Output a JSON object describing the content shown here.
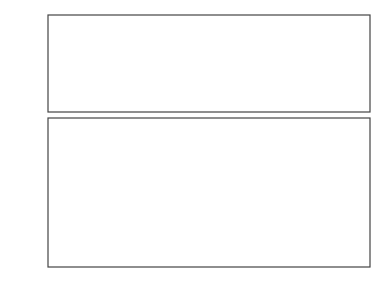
{
  "chart_data": [
    {
      "type": "line",
      "title": "",
      "ylabel_lines": [
        "CV",
        "&",
        "SP",
        "[%]"
      ],
      "xlabel": "",
      "ylim": [
        40,
        80
      ],
      "yticks": [
        "80",
        "40"
      ],
      "grid": false,
      "annotations": [
        "SP",
        "CV"
      ],
      "series": [
        {
          "name": "SP",
          "style": "dashed",
          "values": [
            60,
            60,
            60,
            60,
            60,
            60,
            60,
            60,
            60,
            60,
            60,
            60,
            60,
            60,
            60,
            60,
            60,
            60,
            60,
            60,
            60,
            60,
            60,
            60,
            60,
            60,
            60,
            60,
            60,
            60,
            60,
            60,
            60,
            60,
            60,
            60,
            60,
            60,
            60,
            60,
            60,
            60,
            60,
            60,
            60,
            60,
            60,
            60,
            60,
            60,
            60,
            60,
            60,
            60,
            60,
            60,
            60,
            60,
            60,
            60,
            60,
            60,
            60,
            60,
            60,
            60,
            60,
            60,
            60,
            60,
            60,
            60,
            60,
            60,
            60,
            60,
            60,
            60,
            60,
            60
          ]
        },
        {
          "name": "CV",
          "style": "solid",
          "values": [
            60.5,
            59,
            61,
            58.5,
            60,
            59,
            61.5,
            60.5,
            59,
            60,
            61,
            59.5,
            58.5,
            60.5,
            59,
            61,
            60,
            58,
            59.5,
            61,
            60,
            59,
            60.5,
            61.5,
            59,
            58.5,
            60,
            57.5,
            59,
            60,
            61,
            60.5,
            59.5,
            61,
            62,
            60,
            59.5,
            61,
            60,
            59,
            60.5,
            61,
            59,
            60,
            59.5,
            60.5,
            59,
            61,
            60,
            59.5,
            62,
            60,
            59,
            60.5,
            61,
            59.5,
            60.5,
            60,
            61,
            59,
            60,
            60.5,
            59,
            58,
            57.5,
            58,
            57,
            58,
            59.5,
            60,
            61,
            60.5,
            59.5,
            61,
            60,
            59,
            60.5,
            59.5,
            60,
            58.5
          ]
        }
      ]
    },
    {
      "type": "line",
      "title": "",
      "ylabel_lines": [
        "MV",
        "[%]"
      ],
      "xlabel": "time",
      "ylim": [
        0,
        100
      ],
      "yticks": [
        "100",
        "0"
      ],
      "grid": false,
      "series": [
        {
          "name": "MV",
          "style": "solid",
          "values": [
            78,
            40,
            55,
            38,
            75,
            50,
            70,
            35,
            55,
            78,
            55,
            70,
            40,
            22,
            55,
            70,
            50,
            80,
            45,
            60,
            40,
            18,
            65,
            50,
            30,
            85,
            90,
            70,
            60,
            75,
            50,
            65,
            40,
            35,
            48,
            60,
            45,
            55,
            32,
            5,
            45,
            55,
            40,
            60,
            45,
            50,
            70,
            55,
            35,
            60,
            80,
            45,
            70,
            40,
            55,
            25,
            65,
            50,
            10,
            55,
            40,
            75,
            45,
            70,
            50,
            8,
            45,
            95,
            85,
            100,
            78,
            85,
            70,
            65,
            72,
            55,
            45,
            60,
            50,
            35,
            55,
            45,
            60,
            35,
            50,
            58,
            40,
            65,
            30,
            25,
            45,
            65,
            60,
            80,
            55,
            85,
            70,
            60,
            88,
            75
          ]
        }
      ]
    }
  ],
  "labels": {
    "top_y_label": [
      "CV",
      "&",
      "SP",
      "[%]"
    ],
    "top_y_max": "80",
    "top_y_min": "40",
    "bottom_y_label": [
      "MV",
      "[%]"
    ],
    "bottom_y_max": "100",
    "bottom_y_min": "0",
    "x_label": "time",
    "sp_annotation": "SP",
    "cv_annotation": "CV"
  }
}
